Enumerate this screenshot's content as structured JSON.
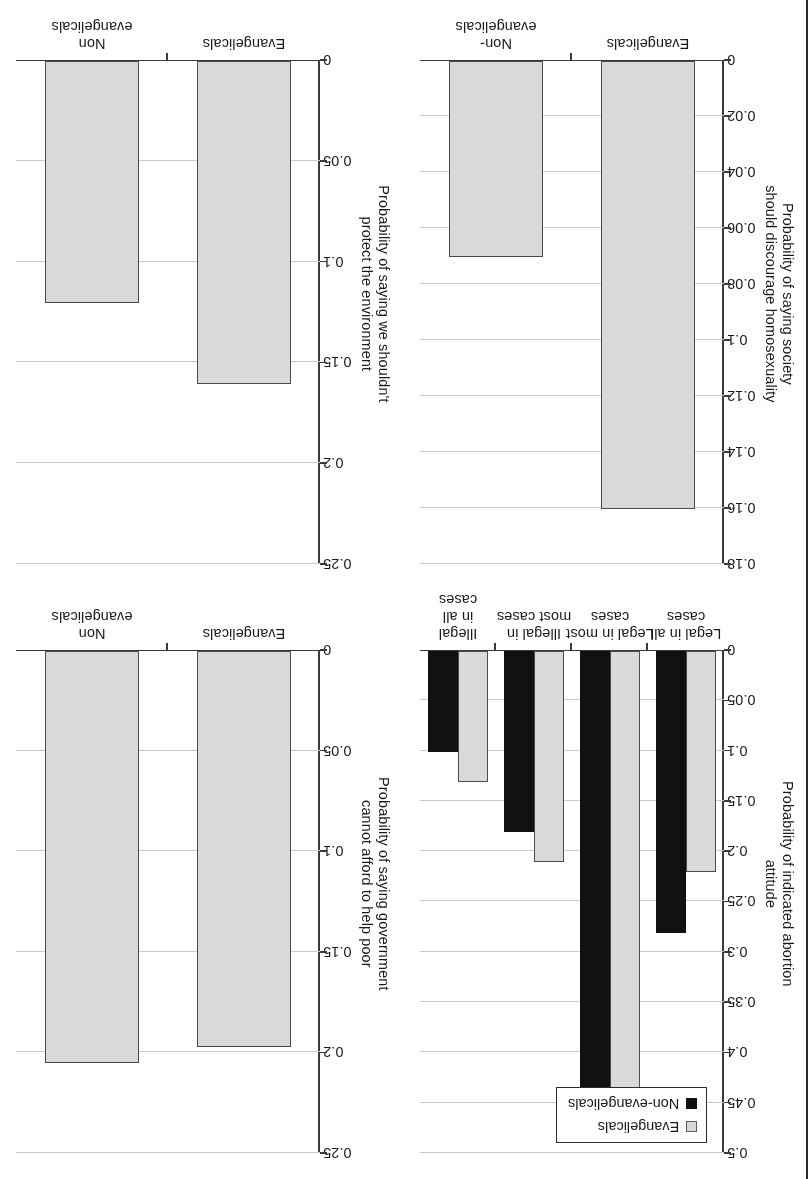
{
  "figure": {
    "rotation_degrees": 180,
    "panel_count": 4,
    "bar_fill_evangelicals": "#d9d9d9",
    "bar_fill_nonevangelicals_solid": "#111111",
    "grid_color": "#c9c9c9",
    "axis_color": "#3a3a3a"
  },
  "legend": {
    "items": [
      {
        "label": "Evangelicals",
        "swatch": "gray"
      },
      {
        "label": "Non-evangelicals",
        "swatch": "black"
      }
    ]
  },
  "chart_data": [
    {
      "id": "abortion",
      "type": "bar",
      "title": "",
      "ylabel": "Probability of indicated abortion attitude",
      "ylabel_lines": [
        "Probability of indicated abortion",
        "attitude"
      ],
      "xlabel": "",
      "categories": [
        "Legal in all cases",
        "Legal in most cases",
        "Illegal in most cases",
        "Illegal in all cases"
      ],
      "category_lines": [
        [
          "Legal in all",
          "cases"
        ],
        [
          "Legal in most",
          "cases"
        ],
        [
          "Illegal in",
          "most cases"
        ],
        [
          "Illegal in all",
          "cases"
        ]
      ],
      "series": [
        {
          "name": "Evangelicals",
          "values": [
            0.22,
            0.45,
            0.21,
            0.13
          ]
        },
        {
          "name": "Non-evangelicals",
          "values": [
            0.28,
            0.46,
            0.18,
            0.1
          ]
        }
      ],
      "ylim": [
        0,
        0.5
      ],
      "yticks": [
        0,
        0.05,
        0.1,
        0.15,
        0.2,
        0.25,
        0.3,
        0.35,
        0.4,
        0.45,
        0.5
      ],
      "ytick_labels": [
        "0",
        "0.05",
        "0.1",
        "0.15",
        "0.2",
        "0.25",
        "0.3",
        "0.35",
        "0.4",
        "0.45",
        "0.5"
      ],
      "grid": true,
      "legend_position": "upper-left",
      "has_legend": true
    },
    {
      "id": "homosexuality",
      "type": "bar",
      "title": "",
      "ylabel": "Probability of saying society should discourage homosexuality",
      "ylabel_lines": [
        "Probability of saying society",
        "should discourage homosexuality"
      ],
      "xlabel": "",
      "categories": [
        "Evangelicals",
        "Non-evangelicals"
      ],
      "category_lines": [
        [
          "Evangelicals"
        ],
        [
          "Non-evangelicals"
        ]
      ],
      "series": [
        {
          "name": "Probability",
          "values": [
            0.16,
            0.07
          ]
        }
      ],
      "ylim": [
        0,
        0.18
      ],
      "yticks": [
        0,
        0.02,
        0.04,
        0.06,
        0.08,
        0.1,
        0.12,
        0.14,
        0.16,
        0.18
      ],
      "ytick_labels": [
        "0",
        "0.02",
        "0.04",
        "0.06",
        "0.08",
        "0.1",
        "0.12",
        "0.14",
        "0.16",
        "0.18"
      ],
      "grid": true,
      "has_legend": false
    },
    {
      "id": "help-poor",
      "type": "bar",
      "title": "",
      "ylabel": "Probability of saying government cannot afford to help poor",
      "ylabel_lines": [
        "Probability of saying government",
        "cannot afford to help poor"
      ],
      "xlabel": "",
      "categories": [
        "Evangelicals",
        "Non evangelicals"
      ],
      "category_lines": [
        [
          "Evangelicals"
        ],
        [
          "Non evangelicals"
        ]
      ],
      "series": [
        {
          "name": "Probability",
          "values": [
            0.197,
            0.205
          ]
        }
      ],
      "ylim": [
        0,
        0.25
      ],
      "yticks": [
        0,
        0.05,
        0.1,
        0.15,
        0.2,
        0.25
      ],
      "ytick_labels": [
        "0",
        "0.05",
        "0.1",
        "0.15",
        "0.2",
        "0.25"
      ],
      "grid": true,
      "has_legend": false
    },
    {
      "id": "environment",
      "type": "bar",
      "title": "",
      "ylabel": "Probability of saying we shouldn't protect the environment",
      "ylabel_lines": [
        "Probability of saying we shouldn't",
        "protect the environment"
      ],
      "xlabel": "",
      "categories": [
        "Evangelicals",
        "Non evangelicals"
      ],
      "category_lines": [
        [
          "Evangelicals"
        ],
        [
          "Non evangelicals"
        ]
      ],
      "series": [
        {
          "name": "Probability",
          "values": [
            0.16,
            0.12
          ]
        }
      ],
      "ylim": [
        0,
        0.25
      ],
      "yticks": [
        0,
        0.05,
        0.1,
        0.15,
        0.2,
        0.25
      ],
      "ytick_labels": [
        "0",
        "0.05",
        "0.1",
        "0.15",
        "0.2",
        "0.25"
      ],
      "grid": true,
      "has_legend": false
    }
  ],
  "panel_layout": {
    "top_left": "homosexuality",
    "top_right": "environment",
    "bottom_left": "abortion",
    "bottom_right": "help-poor"
  }
}
